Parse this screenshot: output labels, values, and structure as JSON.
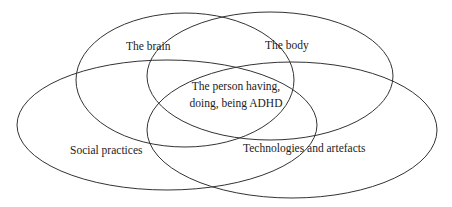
{
  "diagram": {
    "type": "venn",
    "stroke_color": "#333333",
    "sets": [
      {
        "id": "brain",
        "label": "The brain"
      },
      {
        "id": "body",
        "label": "The body"
      },
      {
        "id": "social",
        "label": "Social practices"
      },
      {
        "id": "tech",
        "label": "Technologies and artefacts"
      }
    ],
    "center_label": {
      "line1": "The person having,",
      "line2": "doing, being ADHD"
    }
  }
}
